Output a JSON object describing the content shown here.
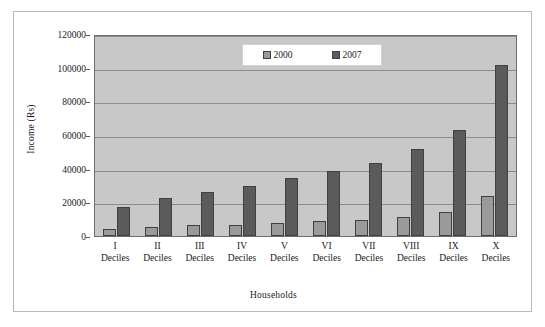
{
  "chart_data": {
    "type": "bar",
    "title": "",
    "xlabel": "Households",
    "ylabel": "Income (Rs)",
    "categories": [
      "I Deciles",
      "II Deciles",
      "III Deciles",
      "IV Deciles",
      "V Deciles",
      "VI Deciles",
      "VII Deciles",
      "VIII Deciles",
      "IX Deciles",
      "X Deciles"
    ],
    "category_parts": [
      {
        "roman": "I",
        "word": "Deciles"
      },
      {
        "roman": "II",
        "word": "Deciles"
      },
      {
        "roman": "III",
        "word": "Deciles"
      },
      {
        "roman": "IV",
        "word": "Deciles"
      },
      {
        "roman": "V",
        "word": "Deciles"
      },
      {
        "roman": "VI",
        "word": "Deciles"
      },
      {
        "roman": "VII",
        "word": "Deciles"
      },
      {
        "roman": "VIII",
        "word": "Deciles"
      },
      {
        "roman": "IX",
        "word": "Deciles"
      },
      {
        "roman": "X",
        "word": "Deciles"
      }
    ],
    "series": [
      {
        "name": "2000",
        "color": "#9a9a9a",
        "values": [
          4200,
          5500,
          6300,
          6600,
          7500,
          8800,
          9400,
          11500,
          14300,
          23800
        ]
      },
      {
        "name": "2007",
        "color": "#5b5b5b",
        "values": [
          17300,
          22700,
          26200,
          30000,
          34600,
          38800,
          43500,
          51500,
          62800,
          101800
        ]
      }
    ],
    "ylim": [
      0,
      120000
    ],
    "ytick_values": [
      0,
      20000,
      40000,
      60000,
      80000,
      100000,
      120000
    ],
    "ytick_labels": [
      "0",
      "20000",
      "40000",
      "60000",
      "80000",
      "100000",
      "120000"
    ],
    "grid": true,
    "legend_position": "top-center",
    "plot_background": "#c8c8c8",
    "frame_color": "#b9b9b9"
  },
  "legend": {
    "entries": [
      {
        "label": "2000"
      },
      {
        "label": "2007"
      }
    ]
  }
}
